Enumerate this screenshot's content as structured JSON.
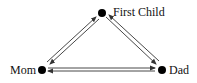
{
  "diagram": {
    "type": "directed-graph",
    "nodes": [
      {
        "id": "first_child",
        "label": "First Child"
      },
      {
        "id": "mom",
        "label": "Mom"
      },
      {
        "id": "dad",
        "label": "Dad"
      }
    ],
    "edges": [
      {
        "from": "mom",
        "to": "first_child",
        "bidirectional": true
      },
      {
        "from": "first_child",
        "to": "dad",
        "bidirectional": true
      },
      {
        "from": "mom",
        "to": "dad",
        "bidirectional": true
      }
    ],
    "colors": {
      "node": "#000000",
      "edge": "#333333",
      "background": "#ffffff"
    }
  }
}
